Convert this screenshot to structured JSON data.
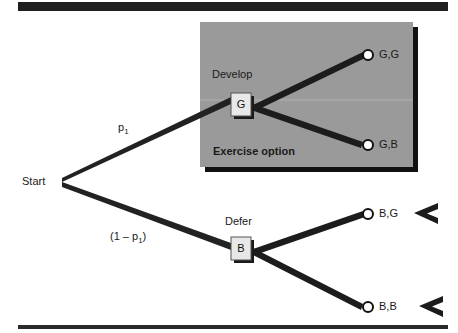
{
  "figure": {
    "type": "decision-tree-diagram",
    "title_bar": {
      "name": "top-rule"
    },
    "bottom_rule": {
      "name": "bottom-rule"
    },
    "colors": {
      "ink": "#1a1a1a",
      "panel_fill": "#9a9a9a",
      "panel_shadow": "#111111",
      "node_fill": "#e6e6e6",
      "node_border": "#4a4a4a",
      "node_shadow": "#1a1a1a",
      "terminal_fill": "#ffffff",
      "terminal_stroke": "#111111",
      "page_bg": "#ffffff"
    }
  },
  "highlight_panel": {
    "caption": "Exercise option",
    "x": 200,
    "y": 22,
    "w": 213,
    "h": 145
  },
  "root": {
    "label": "Start",
    "x": 62,
    "y": 182
  },
  "branches": [
    {
      "name": "good-branch",
      "probability_label": "p",
      "probability_sub": "1",
      "from": "Start",
      "to": "G"
    },
    {
      "name": "bad-branch",
      "probability_label": "(1 – p",
      "probability_sub": "1",
      "probability_tail": ")",
      "from": "Start",
      "to": "B"
    }
  ],
  "decision_nodes": [
    {
      "id": "G",
      "letter": "G",
      "action_label": "Develop",
      "x": 231,
      "y": 93,
      "w": 20,
      "h": 23,
      "outcomes": [
        "G,G",
        "G,B"
      ]
    },
    {
      "id": "B",
      "letter": "B",
      "action_label": "Defer",
      "x": 231,
      "y": 237,
      "w": 20,
      "h": 23,
      "outcomes": [
        "B,G",
        "B,B"
      ]
    }
  ],
  "terminals": [
    {
      "id": "GG",
      "label": "G,G",
      "cx": 368,
      "cy": 55,
      "has_chevron": false
    },
    {
      "id": "GB",
      "label": "G,B",
      "cx": 368,
      "cy": 145,
      "has_chevron": false
    },
    {
      "id": "BG",
      "label": "B,G",
      "cx": 368,
      "cy": 214,
      "has_chevron": true
    },
    {
      "id": "BB",
      "label": "B,B",
      "cx": 368,
      "cy": 307,
      "has_chevron": true
    }
  ],
  "labels": {
    "start": "Start",
    "develop": "Develop",
    "defer": "Defer",
    "exercise_option": "Exercise option",
    "g_letter": "G",
    "b_letter": "B",
    "p1_main": "p",
    "p1_sub": "1",
    "one_minus_p1_pre": "(1 – p",
    "one_minus_p1_sub": "1",
    "one_minus_p1_post": ")",
    "terminal_gg": "G,G",
    "terminal_gb": "G,B",
    "terminal_bg": "B,G",
    "terminal_bb": "B,B"
  }
}
